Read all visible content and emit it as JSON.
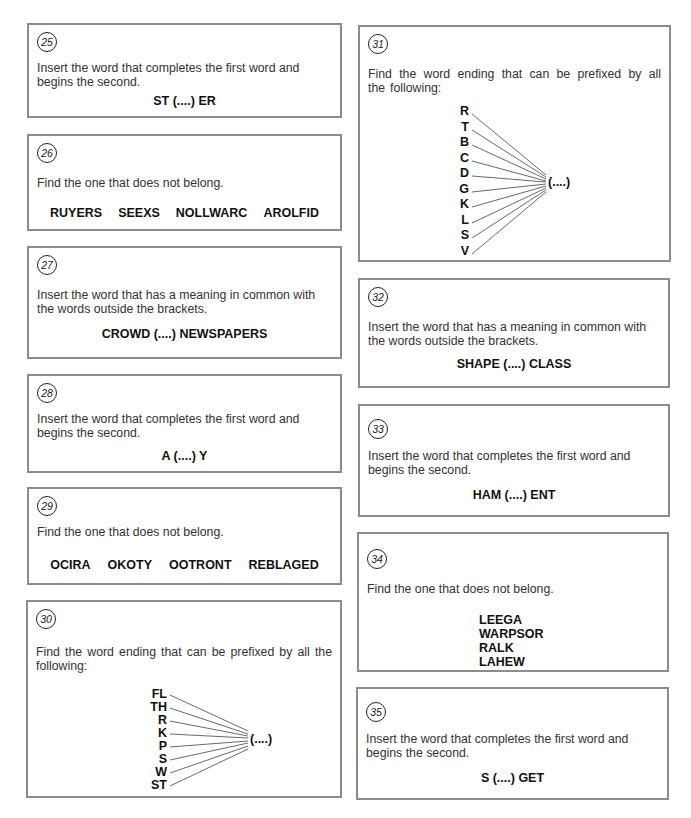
{
  "page": {
    "border_color": "#8c8c8c",
    "text_color": "#1a1a1a"
  },
  "puzzles": {
    "p25": {
      "number": "25",
      "instruction": "Insert the word that completes the first word and begins the second.",
      "puzzle": "ST (....) ER"
    },
    "p26": {
      "number": "26",
      "instruction": "Find the one that does not belong.",
      "words": [
        "RUYERS",
        "SEEXS",
        "NOLLWARC",
        "AROLFID"
      ]
    },
    "p27": {
      "number": "27",
      "instruction": "Insert the word that has a meaning in common with the words outside the brackets.",
      "puzzle": "CROWD (....) NEWSPAPERS"
    },
    "p28": {
      "number": "28",
      "instruction": "Insert the word that completes the first word and begins the second.",
      "puzzle": "A (....) Y"
    },
    "p29": {
      "number": "29",
      "instruction": "Find the one that does not belong.",
      "words": [
        "OCIRA",
        "OKOTY",
        "OOTRONT",
        "REBLAGED"
      ]
    },
    "p30": {
      "number": "30",
      "instruction": "Find the word ending that can be prefixed by all the following:",
      "prefixes": [
        "FL",
        "TH",
        "R",
        "K",
        "P",
        "S",
        "W",
        "ST"
      ],
      "blank": "(....)"
    },
    "p31": {
      "number": "31",
      "instruction": "Find the word ending that can be prefixed by all the following:",
      "prefixes": [
        "R",
        "T",
        "B",
        "C",
        "D",
        "G",
        "K",
        "L",
        "S",
        "V"
      ],
      "blank": "(....)"
    },
    "p32": {
      "number": "32",
      "instruction": "Insert the word that has a meaning in common with the words outside the brackets.",
      "puzzle": "SHAPE (....) CLASS"
    },
    "p33": {
      "number": "33",
      "instruction": "Insert the word that completes the first word and begins the second.",
      "puzzle": "HAM (....) ENT"
    },
    "p34": {
      "number": "34",
      "instruction": "Find the one that does not belong.",
      "words": [
        "LEEGA",
        "WARPSOR",
        "RALK",
        "LAHEW"
      ]
    },
    "p35": {
      "number": "35",
      "instruction": "Insert the word that completes the first word and begins the second.",
      "puzzle": "S (....) GET"
    }
  }
}
